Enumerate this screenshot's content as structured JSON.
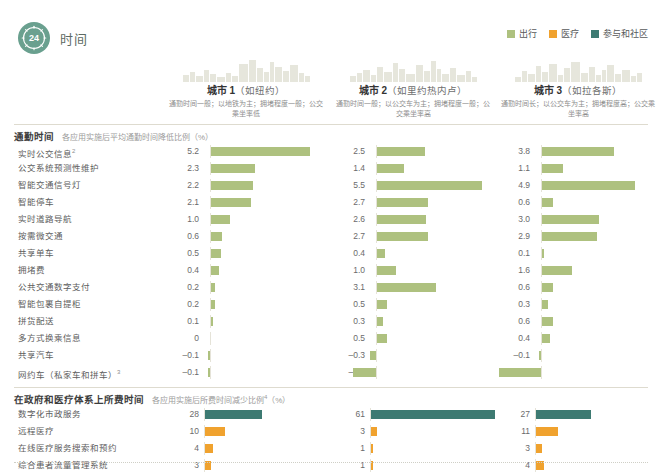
{
  "brand": {
    "badge_number": "24",
    "title": "时间",
    "badge_color": "#6aa08f",
    "icon": "clock-24-icon"
  },
  "legend": {
    "items": [
      {
        "label": "出行",
        "color": "#aec17f",
        "name": "legend-mobility"
      },
      {
        "label": "医疗",
        "color": "#f0a22e",
        "name": "legend-health"
      },
      {
        "label": "参与和社区",
        "color": "#3d7a72",
        "name": "legend-engagement"
      }
    ]
  },
  "columns": [
    {
      "name": "城市 1",
      "paren": "（如纽约）",
      "desc": "通勤时间一般；以地铁为主；拥堵程度一般；公交乘坐率低"
    },
    {
      "name": "城市 2",
      "paren": "（如里约热内卢）",
      "desc": "通勤时间一般；以公交车为主；拥堵程度一般；公交乘坐率高"
    },
    {
      "name": "城市 3",
      "paren": "（如拉各斯）",
      "desc": "通勤时间长；以公交车为主；拥堵程度高；公交乘坐率高"
    }
  ],
  "sections": [
    {
      "title": "通勤时间",
      "subtitle": "各应用实施后平均通勤时间降低比例（%）",
      "rows": [
        {
          "label": "实时公交信息",
          "sup": "2"
        },
        {
          "label": "公交系统预测性维护",
          "sup": ""
        },
        {
          "label": "智能交通信号灯",
          "sup": ""
        },
        {
          "label": "智能停车",
          "sup": ""
        },
        {
          "label": "实时道路导航",
          "sup": ""
        },
        {
          "label": "按需微交通",
          "sup": ""
        },
        {
          "label": "共享单车",
          "sup": ""
        },
        {
          "label": "拥堵费",
          "sup": ""
        },
        {
          "label": "公共交通数字支付",
          "sup": ""
        },
        {
          "label": "智能包裹自提柜",
          "sup": ""
        },
        {
          "label": "拼货配送",
          "sup": ""
        },
        {
          "label": "多方式换乘信息",
          "sup": ""
        },
        {
          "label": "共享汽车",
          "sup": ""
        },
        {
          "label": "网约车（私家车和拼车）",
          "sup": "3"
        }
      ]
    },
    {
      "title": "在政府和医疗体系上所费时间",
      "subtitle": "各应用实施后所费时间减少比例",
      "subtitle_sup": "4",
      "subtitle_tail": "（%）",
      "rows": [
        {
          "label": "数字化市政服务",
          "sup": ""
        },
        {
          "label": "远程医疗",
          "sup": ""
        },
        {
          "label": "在线医疗服务搜索和预约",
          "sup": ""
        },
        {
          "label": "综合患者流量管理系统",
          "sup": ""
        }
      ]
    }
  ],
  "chart_data": {
    "type": "bar",
    "title": "时间",
    "orientation": "horizontal",
    "grid": false,
    "legend_position": "top-right",
    "panels": [
      {
        "section": "通勤时间",
        "ylabel": "各应用实施后平均通勤时间降低比例（%）",
        "categories": [
          "实时公交信息",
          "公交系统预测性维护",
          "智能交通信号灯",
          "智能停车",
          "实时道路导航",
          "按需微交通",
          "共享单车",
          "拥堵费",
          "公共交通数字支付",
          "智能包裹自提柜",
          "拼货配送",
          "多方式换乘信息",
          "共享汽车",
          "网约车（私家车和拼车）"
        ],
        "series": [
          {
            "name": "城市 1",
            "color": "#aec17f",
            "values": [
              5.2,
              2.3,
              2.2,
              2.1,
              1.0,
              0.6,
              0.5,
              0.4,
              0.2,
              0.2,
              0.1,
              0,
              -0.1,
              -0.1
            ],
            "labels": [
              "5.2",
              "2.3",
              "2.2",
              "2.1",
              "1.0",
              "0.6",
              "0.5",
              "0.4",
              "0.2",
              "0.2",
              "0.1",
              "0",
              "–0.1",
              "–0.1"
            ]
          },
          {
            "name": "城市 2",
            "color": "#aec17f",
            "values": [
              2.5,
              1.4,
              5.5,
              2.7,
              2.6,
              2.7,
              0.4,
              1.0,
              3.1,
              0.5,
              0.3,
              0.5,
              -0.3,
              -1.2
            ],
            "labels": [
              "2.5",
              "1.4",
              "5.5",
              "2.7",
              "2.6",
              "2.7",
              "0.4",
              "1.0",
              "3.1",
              "0.5",
              "0.3",
              "0.5",
              "–0.3",
              "–1.2"
            ]
          },
          {
            "name": "城市 3",
            "color": "#aec17f",
            "values": [
              3.8,
              1.1,
              4.9,
              0.6,
              3.0,
              2.9,
              0.1,
              1.6,
              0.6,
              0.3,
              0.6,
              0.4,
              -0.1,
              -2.2
            ],
            "labels": [
              "3.8",
              "1.1",
              "4.9",
              "0.6",
              "3.0",
              "2.9",
              "0.1",
              "1.6",
              "0.6",
              "0.3",
              "0.6",
              "0.4",
              "–0.1",
              "–2.2"
            ]
          }
        ],
        "xlim": [
          -2.4,
          5.6
        ]
      },
      {
        "section": "在政府和医疗体系上所费时间",
        "ylabel": "各应用实施后所费时间减少比例（%）",
        "categories": [
          "数字化市政服务",
          "远程医疗",
          "在线医疗服务搜索和预约",
          "综合患者流量管理系统"
        ],
        "series": [
          {
            "name": "城市 1",
            "values": [
              28,
              10,
              4,
              3
            ],
            "labels": [
              "28",
              "10",
              "4",
              "3"
            ],
            "colors": [
              "#3d7a72",
              "#f0a22e",
              "#f0a22e",
              "#f0a22e"
            ]
          },
          {
            "name": "城市 2",
            "values": [
              61,
              3,
              1,
              1
            ],
            "labels": [
              "61",
              "3",
              "1",
              "1"
            ],
            "colors": [
              "#3d7a72",
              "#f0a22e",
              "#f0a22e",
              "#f0a22e"
            ]
          },
          {
            "name": "城市 3",
            "values": [
              27,
              11,
              3,
              4
            ],
            "labels": [
              "27",
              "11",
              "3",
              "4"
            ],
            "colors": [
              "#3d7a72",
              "#f0a22e",
              "#f0a22e",
              "#f0a22e"
            ]
          }
        ],
        "xlim": [
          0,
          62
        ]
      }
    ]
  }
}
